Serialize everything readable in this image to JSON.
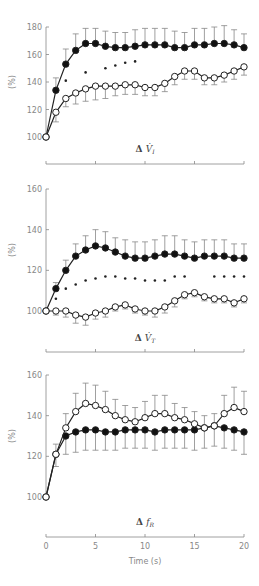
{
  "chart_data": [
    {
      "type": "line",
      "title": "",
      "panel_label": "ΔV̇I",
      "xlabel": "",
      "ylabel": "(%)",
      "xlim": [
        0,
        20
      ],
      "ylim": [
        100,
        180
      ],
      "yticks": [
        100,
        120,
        140,
        160,
        180
      ],
      "xticks": [
        0,
        5,
        10,
        15,
        20
      ],
      "x": [
        0,
        1,
        2,
        3,
        4,
        5,
        6,
        7,
        8,
        9,
        10,
        11,
        12,
        13,
        14,
        15,
        16,
        17,
        18,
        19,
        20
      ],
      "series": [
        {
          "name": "filled",
          "marker": "filled-circle",
          "values": [
            100,
            134,
            153,
            163,
            168,
            168,
            166,
            165,
            165,
            166,
            167,
            167,
            167,
            165,
            165,
            167,
            167,
            168,
            168,
            167,
            165
          ],
          "err_up": [
            0,
            9,
            11,
            12,
            11,
            11,
            11,
            11,
            11,
            12,
            12,
            12,
            12,
            12,
            11,
            12,
            12,
            12,
            13,
            11,
            10
          ]
        },
        {
          "name": "open",
          "marker": "open-circle",
          "values": [
            100,
            118,
            128,
            132,
            135,
            137,
            137,
            137,
            138,
            138,
            136,
            136,
            139,
            144,
            148,
            148,
            143,
            143,
            145,
            148,
            151
          ],
          "err_down": [
            0,
            7,
            6,
            8,
            9,
            10,
            9,
            7,
            7,
            7,
            6,
            6,
            6,
            6,
            6,
            6,
            5,
            5,
            5,
            6,
            6
          ]
        }
      ],
      "significance_dots": {
        "x": [
          2,
          4,
          6,
          7,
          8,
          9
        ],
        "y": [
          141,
          147,
          150,
          152,
          154,
          155
        ]
      }
    },
    {
      "type": "line",
      "panel_label": "ΔV̇T",
      "xlabel": "",
      "ylabel": "(%)",
      "xlim": [
        0,
        20
      ],
      "ylim": [
        100,
        160
      ],
      "yticks": [
        100,
        120,
        140,
        160
      ],
      "xticks": [
        0,
        5,
        10,
        15,
        20
      ],
      "x": [
        0,
        1,
        2,
        3,
        4,
        5,
        6,
        7,
        8,
        9,
        10,
        11,
        12,
        13,
        14,
        15,
        16,
        17,
        18,
        19,
        20
      ],
      "series": [
        {
          "name": "filled",
          "marker": "filled-circle",
          "values": [
            100,
            111,
            120,
            127,
            130,
            132,
            131,
            129,
            127,
            126,
            126,
            127,
            128,
            128,
            127,
            126,
            127,
            127,
            127,
            126,
            126
          ],
          "err_up": [
            0,
            3,
            5,
            6,
            7,
            8,
            8,
            7,
            8,
            8,
            8,
            8,
            9,
            9,
            8,
            8,
            8,
            8,
            8,
            7,
            7
          ]
        },
        {
          "name": "open",
          "marker": "open-circle",
          "values": [
            100,
            100,
            100,
            98,
            97,
            99,
            100,
            102,
            103,
            101,
            100,
            100,
            102,
            105,
            108,
            109,
            107,
            106,
            106,
            104,
            106
          ],
          "err_down": [
            0,
            2,
            3,
            4,
            4,
            3,
            3,
            2,
            2,
            2,
            2,
            3,
            3,
            3,
            2,
            2,
            2,
            2,
            2,
            2,
            2
          ]
        }
      ],
      "significance_dots": {
        "x": [
          1,
          2,
          3,
          4,
          5,
          6,
          7,
          8,
          9,
          10,
          11,
          12,
          13,
          14,
          17,
          18,
          19,
          20
        ],
        "y": [
          106,
          111,
          113,
          115,
          116,
          117,
          117,
          116,
          116,
          115,
          115,
          115,
          117,
          117,
          117,
          117,
          117,
          117
        ]
      }
    },
    {
      "type": "line",
      "panel_label": "ΔfR",
      "xlabel": "Time (s)",
      "ylabel": "(%)",
      "xlim": [
        0,
        20
      ],
      "ylim": [
        100,
        160
      ],
      "yticks": [
        100,
        120,
        140,
        160
      ],
      "xticks": [
        0,
        5,
        10,
        15,
        20
      ],
      "x": [
        0,
        1,
        2,
        3,
        4,
        5,
        6,
        7,
        8,
        9,
        10,
        11,
        12,
        13,
        14,
        15,
        16,
        17,
        18,
        19,
        20
      ],
      "series": [
        {
          "name": "filled",
          "marker": "filled-circle",
          "values": [
            100,
            121,
            130,
            132,
            133,
            133,
            132,
            132,
            133,
            133,
            133,
            132,
            133,
            133,
            133,
            133,
            134,
            135,
            134,
            133,
            132
          ],
          "err_down": [
            0,
            6,
            9,
            10,
            10,
            10,
            9,
            9,
            9,
            9,
            9,
            9,
            9,
            9,
            9,
            10,
            10,
            10,
            10,
            10,
            11
          ]
        },
        {
          "name": "open",
          "marker": "open-circle",
          "values": [
            100,
            121,
            134,
            142,
            146,
            145,
            143,
            140,
            138,
            137,
            139,
            141,
            141,
            139,
            138,
            136,
            134,
            135,
            141,
            144,
            142
          ],
          "err_up": [
            0,
            5,
            7,
            9,
            10,
            10,
            9,
            8,
            7,
            7,
            8,
            9,
            9,
            7,
            6,
            6,
            6,
            6,
            9,
            10,
            10
          ]
        }
      ]
    }
  ],
  "panels": [
    {
      "label_symbol": "Δ",
      "label_var": "V̇",
      "label_sub": "I",
      "ylabel": "(%)",
      "yticks": [
        "100",
        "120",
        "140",
        "160",
        "180"
      ]
    },
    {
      "label_symbol": "Δ",
      "label_var": "V̇",
      "label_sub": "T",
      "ylabel": "(%)",
      "yticks": [
        "100",
        "120",
        "140",
        "160"
      ]
    },
    {
      "label_symbol": "Δ",
      "label_var": "f",
      "label_sub": "R",
      "ylabel": "(%)",
      "yticks": [
        "100",
        "120",
        "140",
        "160"
      ],
      "xticks": [
        "0",
        "5",
        "10",
        "15",
        "20"
      ],
      "xlabel": "Time (s)"
    }
  ],
  "colors": {
    "line": "#222222",
    "axis": "#888888",
    "error": "#888888",
    "open_fill": "#ffffff"
  }
}
